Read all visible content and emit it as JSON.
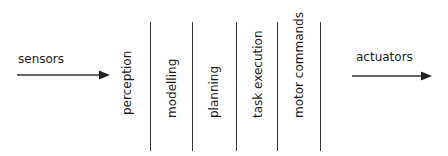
{
  "diagram": {
    "input": {
      "label": "sensors"
    },
    "output": {
      "label": "actuators"
    },
    "stages": [
      {
        "label": "perception"
      },
      {
        "label": "modelling"
      },
      {
        "label": "planning"
      },
      {
        "label": "task execution"
      },
      {
        "label": "motor commands"
      }
    ]
  }
}
